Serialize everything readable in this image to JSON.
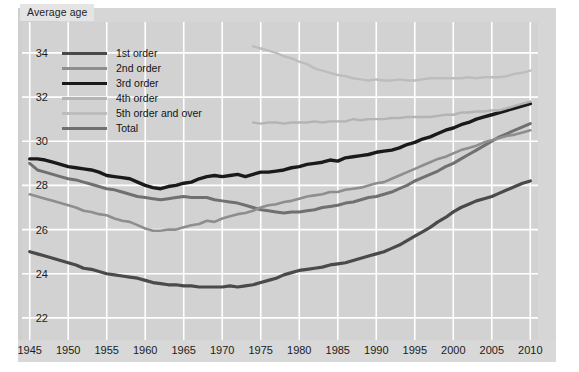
{
  "figure": {
    "axis_title": "Average age",
    "background_color": "#d2d2d2",
    "card_color": "#d6d6d6",
    "gridline_color": "#ffffff"
  },
  "legend": {
    "position": "top-left-inside",
    "items": [
      {
        "label": "1st order",
        "color": "#4a4a4a",
        "width": 3.2
      },
      {
        "label": "2nd order",
        "color": "#8e8e8e",
        "width": 2.6
      },
      {
        "label": "3rd order",
        "color": "#1a1a1a",
        "width": 3.4
      },
      {
        "label": "4th order",
        "color": "#b4b4b4",
        "width": 2.4
      },
      {
        "label": "5th order and over",
        "color": "#bdbdbd",
        "width": 2.4
      },
      {
        "label": "Total",
        "color": "#707070",
        "width": 3.0
      }
    ]
  },
  "chart_data": {
    "type": "line",
    "title": "",
    "subtitle": "",
    "xlabel": "",
    "ylabel": "Average age",
    "xlim": [
      1944,
      2011
    ],
    "ylim": [
      21.0,
      35.4
    ],
    "xticks": [
      1945,
      1950,
      1955,
      1960,
      1965,
      1970,
      1975,
      1980,
      1985,
      1990,
      1995,
      2000,
      2005,
      2010
    ],
    "yticks": [
      22,
      24,
      26,
      28,
      30,
      32,
      34
    ],
    "grid": true,
    "series": [
      {
        "name": "3rd order",
        "color": "#1a1a1a",
        "x": [
          1945,
          1946,
          1947,
          1948,
          1949,
          1950,
          1951,
          1952,
          1953,
          1954,
          1955,
          1956,
          1957,
          1958,
          1959,
          1960,
          1961,
          1962,
          1963,
          1964,
          1965,
          1966,
          1967,
          1968,
          1969,
          1970,
          1971,
          1972,
          1973,
          1974,
          1975,
          1976,
          1977,
          1978,
          1979,
          1980,
          1981,
          1982,
          1983,
          1984,
          1985,
          1986,
          1987,
          1988,
          1989,
          1990,
          1991,
          1992,
          1993,
          1994,
          1995,
          1996,
          1997,
          1998,
          1999,
          2000,
          2001,
          2002,
          2003,
          2004,
          2005,
          2006,
          2007,
          2008,
          2009,
          2010
        ],
        "values": [
          29.2,
          29.2,
          29.15,
          29.05,
          28.95,
          28.85,
          28.8,
          28.75,
          28.7,
          28.6,
          28.45,
          28.4,
          28.35,
          28.3,
          28.15,
          28.0,
          27.9,
          27.85,
          27.95,
          28.0,
          28.1,
          28.15,
          28.3,
          28.4,
          28.45,
          28.4,
          28.45,
          28.5,
          28.4,
          28.5,
          28.6,
          28.6,
          28.65,
          28.7,
          28.8,
          28.85,
          28.95,
          29.0,
          29.05,
          29.15,
          29.1,
          29.25,
          29.3,
          29.35,
          29.4,
          29.5,
          29.55,
          29.6,
          29.7,
          29.85,
          29.95,
          30.1,
          30.2,
          30.35,
          30.5,
          30.6,
          30.75,
          30.85,
          31.0,
          31.1,
          31.2,
          31.3,
          31.4,
          31.5,
          31.6,
          31.7
        ]
      },
      {
        "name": "Total",
        "color": "#707070",
        "x": [
          1945,
          1946,
          1947,
          1948,
          1949,
          1950,
          1951,
          1952,
          1953,
          1954,
          1955,
          1956,
          1957,
          1958,
          1959,
          1960,
          1961,
          1962,
          1963,
          1964,
          1965,
          1966,
          1967,
          1968,
          1969,
          1970,
          1971,
          1972,
          1973,
          1974,
          1975,
          1976,
          1977,
          1978,
          1979,
          1980,
          1981,
          1982,
          1983,
          1984,
          1985,
          1986,
          1987,
          1988,
          1989,
          1990,
          1991,
          1992,
          1993,
          1994,
          1995,
          1996,
          1997,
          1998,
          1999,
          2000,
          2001,
          2002,
          2003,
          2004,
          2005,
          2006,
          2007,
          2008,
          2009,
          2010
        ],
        "values": [
          29.0,
          28.7,
          28.6,
          28.5,
          28.4,
          28.3,
          28.25,
          28.15,
          28.05,
          27.95,
          27.85,
          27.8,
          27.7,
          27.6,
          27.5,
          27.45,
          27.4,
          27.35,
          27.4,
          27.45,
          27.5,
          27.45,
          27.45,
          27.45,
          27.35,
          27.3,
          27.25,
          27.2,
          27.1,
          27.0,
          26.9,
          26.85,
          26.8,
          26.75,
          26.8,
          26.8,
          26.85,
          26.9,
          27.0,
          27.05,
          27.1,
          27.2,
          27.25,
          27.35,
          27.45,
          27.5,
          27.6,
          27.7,
          27.85,
          28.0,
          28.2,
          28.35,
          28.5,
          28.65,
          28.85,
          29.0,
          29.2,
          29.4,
          29.6,
          29.8,
          30.0,
          30.2,
          30.35,
          30.5,
          30.65,
          30.8
        ]
      },
      {
        "name": "2nd order",
        "color": "#8e8e8e",
        "x": [
          1945,
          1946,
          1947,
          1948,
          1949,
          1950,
          1951,
          1952,
          1953,
          1954,
          1955,
          1956,
          1957,
          1958,
          1959,
          1960,
          1961,
          1962,
          1963,
          1964,
          1965,
          1966,
          1967,
          1968,
          1969,
          1970,
          1971,
          1972,
          1973,
          1974,
          1975,
          1976,
          1977,
          1978,
          1979,
          1980,
          1981,
          1982,
          1983,
          1984,
          1985,
          1986,
          1987,
          1988,
          1989,
          1990,
          1991,
          1992,
          1993,
          1994,
          1995,
          1996,
          1997,
          1998,
          1999,
          2000,
          2001,
          2002,
          2003,
          2004,
          2005,
          2006,
          2007,
          2008,
          2009,
          2010
        ],
        "values": [
          27.6,
          27.5,
          27.4,
          27.3,
          27.2,
          27.1,
          27.0,
          26.85,
          26.8,
          26.7,
          26.65,
          26.5,
          26.4,
          26.35,
          26.2,
          26.05,
          25.95,
          25.95,
          26.0,
          26.0,
          26.1,
          26.2,
          26.25,
          26.4,
          26.35,
          26.5,
          26.6,
          26.7,
          26.75,
          26.85,
          27.0,
          27.1,
          27.15,
          27.25,
          27.3,
          27.4,
          27.5,
          27.55,
          27.6,
          27.7,
          27.7,
          27.8,
          27.85,
          27.9,
          28.0,
          28.1,
          28.15,
          28.3,
          28.45,
          28.6,
          28.75,
          28.9,
          29.05,
          29.2,
          29.3,
          29.45,
          29.6,
          29.7,
          29.8,
          29.95,
          30.05,
          30.15,
          30.25,
          30.3,
          30.4,
          30.5
        ]
      },
      {
        "name": "1st order",
        "color": "#4a4a4a",
        "x": [
          1945,
          1946,
          1947,
          1948,
          1949,
          1950,
          1951,
          1952,
          1953,
          1954,
          1955,
          1956,
          1957,
          1958,
          1959,
          1960,
          1961,
          1962,
          1963,
          1964,
          1965,
          1966,
          1967,
          1968,
          1969,
          1970,
          1971,
          1972,
          1973,
          1974,
          1975,
          1976,
          1977,
          1978,
          1979,
          1980,
          1981,
          1982,
          1983,
          1984,
          1985,
          1986,
          1987,
          1988,
          1989,
          1990,
          1991,
          1992,
          1993,
          1994,
          1995,
          1996,
          1997,
          1998,
          1999,
          2000,
          2001,
          2002,
          2003,
          2004,
          2005,
          2006,
          2007,
          2008,
          2009,
          2010
        ],
        "values": [
          25.0,
          24.9,
          24.8,
          24.7,
          24.6,
          24.5,
          24.4,
          24.25,
          24.2,
          24.1,
          24.0,
          23.95,
          23.9,
          23.85,
          23.8,
          23.7,
          23.6,
          23.55,
          23.5,
          23.5,
          23.45,
          23.45,
          23.4,
          23.4,
          23.4,
          23.4,
          23.45,
          23.4,
          23.45,
          23.5,
          23.6,
          23.7,
          23.8,
          23.95,
          24.05,
          24.15,
          24.2,
          24.25,
          24.3,
          24.4,
          24.45,
          24.5,
          24.6,
          24.7,
          24.8,
          24.9,
          25.0,
          25.15,
          25.3,
          25.5,
          25.7,
          25.9,
          26.1,
          26.35,
          26.55,
          26.8,
          27.0,
          27.15,
          27.3,
          27.4,
          27.5,
          27.65,
          27.8,
          27.95,
          28.1,
          28.2
        ]
      },
      {
        "name": "4th order",
        "color": "#b4b4b4",
        "x": [
          1974,
          1975,
          1976,
          1977,
          1978,
          1979,
          1980,
          1981,
          1982,
          1983,
          1984,
          1985,
          1986,
          1987,
          1988,
          1989,
          1990,
          1991,
          1992,
          1993,
          1994,
          1995,
          1996,
          1997,
          1998,
          1999,
          2000,
          2001,
          2002,
          2003,
          2004,
          2005,
          2006,
          2007,
          2008,
          2009,
          2010
        ],
        "values": [
          30.85,
          30.8,
          30.85,
          30.85,
          30.8,
          30.85,
          30.85,
          30.85,
          30.9,
          30.85,
          30.9,
          30.9,
          30.9,
          31.0,
          30.95,
          31.0,
          31.0,
          31.0,
          31.05,
          31.05,
          31.1,
          31.1,
          31.1,
          31.1,
          31.15,
          31.2,
          31.2,
          31.3,
          31.3,
          31.35,
          31.35,
          31.4,
          31.4,
          31.5,
          31.6,
          31.7,
          31.8
        ]
      },
      {
        "name": "5th order and over",
        "color": "#bdbdbd",
        "x": [
          1974,
          1975,
          1976,
          1977,
          1978,
          1979,
          1980,
          1981,
          1982,
          1983,
          1984,
          1985,
          1986,
          1987,
          1988,
          1989,
          1990,
          1991,
          1992,
          1993,
          1994,
          1995,
          1996,
          1997,
          1998,
          1999,
          2000,
          2001,
          2002,
          2003,
          2004,
          2005,
          2006,
          2007,
          2008,
          2009,
          2010
        ],
        "values": [
          34.3,
          34.2,
          34.1,
          34.0,
          33.85,
          33.75,
          33.6,
          33.5,
          33.3,
          33.2,
          33.1,
          33.0,
          32.95,
          32.85,
          32.8,
          32.75,
          32.8,
          32.75,
          32.75,
          32.8,
          32.75,
          32.75,
          32.8,
          32.85,
          32.85,
          32.85,
          32.85,
          32.85,
          32.9,
          32.85,
          32.9,
          32.9,
          32.9,
          32.95,
          33.05,
          33.1,
          33.2
        ]
      }
    ]
  },
  "xaxis_labels": [
    "1945",
    "1950",
    "1955",
    "1960",
    "1965",
    "1970",
    "1975",
    "1980",
    "1985",
    "1990",
    "1995",
    "2000",
    "2005",
    "2010"
  ],
  "yaxis_labels": [
    "34",
    "32",
    "30",
    "28",
    "26",
    "24",
    "22"
  ]
}
